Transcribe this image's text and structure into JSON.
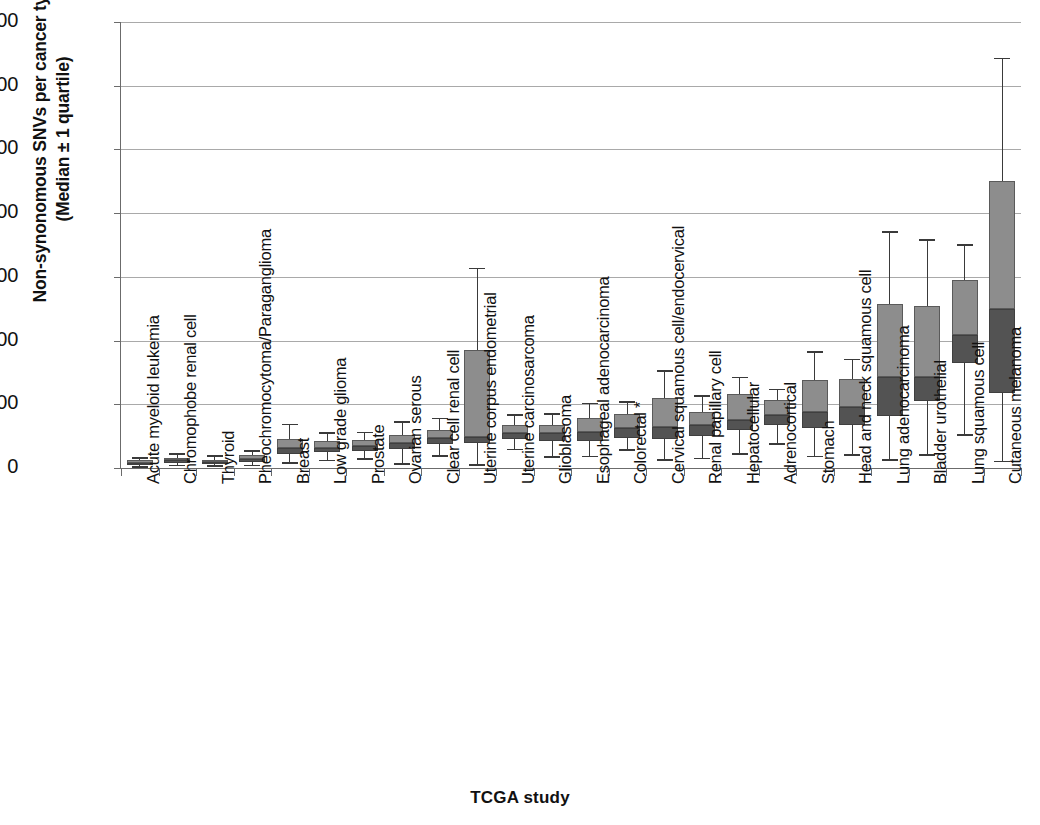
{
  "chart_data": {
    "type": "box",
    "title": "",
    "xlabel": "TCGA study",
    "ylabel": "Non-synonomous SNVs per cancer type\n(Median ± 1 quartile)",
    "ylim": [
      0,
      700
    ],
    "yticks": [
      0,
      100,
      200,
      300,
      400,
      500,
      600,
      700
    ],
    "ytick_labels": [
      "0",
      "100",
      "200",
      "300",
      "400",
      "500",
      "600",
      "700"
    ],
    "grid": true,
    "legend": "none",
    "note": "Box spans Q1 to Q3; internal shade change marks the median. Whiskers show min/max of plotted range.",
    "categories": [
      "Acute myeloid leukemia",
      "Chromophobe renal cell",
      "Thyroid",
      "Pheochromocytoma/Paraganglioma",
      "Breast",
      "Low grade glioma",
      "Prostate",
      "Ovarian serous",
      "Clear cell renal cell",
      "Uterine corpus endometrial",
      "Uterine carcinosarcoma",
      "Glioblasoma",
      "Esophageal adenocarcinoma",
      "Colorectal *",
      "Cervical squamous cell/endocervical",
      "Renal papillary cell",
      "Hepatocellular",
      "Adrenocortical",
      "Stomach",
      "Head and neck squamous cell",
      "Lung adenocarcinoma",
      "Bladder urothelial",
      "Lung squamous cell",
      "Cutaneous melanoma"
    ],
    "boxes": [
      {
        "category": "Acute myeloid leukemia",
        "whisker_low": 2,
        "q1": 5,
        "median": 8,
        "q3": 12,
        "whisker_high": 16
      },
      {
        "category": "Chromophobe renal cell",
        "whisker_low": 4,
        "q1": 8,
        "median": 12,
        "q3": 16,
        "whisker_high": 22
      },
      {
        "category": "Thyroid",
        "whisker_low": 3,
        "q1": 6,
        "median": 9,
        "q3": 13,
        "whisker_high": 19
      },
      {
        "category": "Pheochromocytoma/Paraganglioma",
        "whisker_low": 4,
        "q1": 9,
        "median": 14,
        "q3": 20,
        "whisker_high": 27
      },
      {
        "category": "Breast",
        "whisker_low": 8,
        "q1": 22,
        "median": 31,
        "q3": 46,
        "whisker_high": 68
      },
      {
        "category": "Low grade glioma",
        "whisker_low": 12,
        "q1": 25,
        "median": 32,
        "q3": 43,
        "whisker_high": 55
      },
      {
        "category": "Prostate",
        "whisker_low": 14,
        "q1": 27,
        "median": 34,
        "q3": 44,
        "whisker_high": 56
      },
      {
        "category": "Ovarian serous",
        "whisker_low": 6,
        "q1": 30,
        "median": 40,
        "q3": 52,
        "whisker_high": 72
      },
      {
        "category": "Clear cell renal cell",
        "whisker_low": 19,
        "q1": 38,
        "median": 47,
        "q3": 60,
        "whisker_high": 78
      },
      {
        "category": "Uterine corpus endometrial",
        "whisker_low": 5,
        "q1": 40,
        "median": 48,
        "q3": 185,
        "whisker_high": 313
      },
      {
        "category": "Uterine carcinosarcoma",
        "whisker_low": 29,
        "q1": 46,
        "median": 55,
        "q3": 67,
        "whisker_high": 83
      },
      {
        "category": "Glioblasoma",
        "whisker_low": 17,
        "q1": 43,
        "median": 55,
        "q3": 68,
        "whisker_high": 85
      },
      {
        "category": "Esophageal adenocarcinoma",
        "whisker_low": 18,
        "q1": 42,
        "median": 57,
        "q3": 79,
        "whisker_high": 101
      },
      {
        "category": "Colorectal *",
        "whisker_low": 28,
        "q1": 47,
        "median": 62,
        "q3": 85,
        "whisker_high": 104
      },
      {
        "category": "Cervical squamous cell/endocervical",
        "whisker_low": 13,
        "q1": 45,
        "median": 65,
        "q3": 110,
        "whisker_high": 152
      },
      {
        "category": "Renal papillary cell",
        "whisker_low": 15,
        "q1": 50,
        "median": 67,
        "q3": 88,
        "whisker_high": 113
      },
      {
        "category": "Hepatocellular",
        "whisker_low": 22,
        "q1": 60,
        "median": 76,
        "q3": 116,
        "whisker_high": 142
      },
      {
        "category": "Adrenocortical",
        "whisker_low": 38,
        "q1": 68,
        "median": 83,
        "q3": 106,
        "whisker_high": 123
      },
      {
        "category": "Stomach",
        "whisker_low": 18,
        "q1": 62,
        "median": 88,
        "q3": 138,
        "whisker_high": 182
      },
      {
        "category": "Head and neck squamous cell",
        "whisker_low": 20,
        "q1": 68,
        "median": 96,
        "q3": 139,
        "whisker_high": 170
      },
      {
        "category": "Lung adenocarcinoma",
        "whisker_low": 13,
        "q1": 82,
        "median": 143,
        "q3": 257,
        "whisker_high": 370
      },
      {
        "category": "Bladder urothelial",
        "whisker_low": 20,
        "q1": 105,
        "median": 143,
        "q3": 255,
        "whisker_high": 358
      },
      {
        "category": "Lung squamous cell",
        "whisker_low": 52,
        "q1": 165,
        "median": 208,
        "q3": 295,
        "whisker_high": 350
      },
      {
        "category": "Cutaneous melanoma",
        "whisker_low": 10,
        "q1": 118,
        "median": 250,
        "q3": 450,
        "whisker_high": 643
      }
    ],
    "colors": {
      "box_upper": "#8d8d8d",
      "box_lower": "#535353",
      "whisker": "#3a3a3a",
      "grid": "#a9a9a9",
      "axis": "#6b6b6b",
      "text": "#111111",
      "background": "#ffffff"
    }
  }
}
